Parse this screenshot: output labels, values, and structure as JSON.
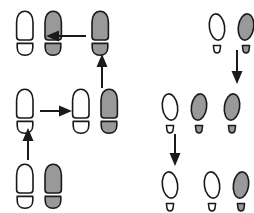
{
  "diagram": {
    "title": "Footprint sequence diagram",
    "canvas": {
      "width": 254,
      "height": 213,
      "background": "#ffffff"
    },
    "colors": {
      "outline": "#1a1a1a",
      "left_foot_fill": "#ffffff",
      "right_foot_fill": "#999999",
      "arrow": "#1a1a1a"
    },
    "groups": [
      {
        "id": "shoe-sequence",
        "name": "shoe-print-sequence",
        "print_style": "shoe",
        "nodes": [
          {
            "id": "shoe-n1",
            "name": "shoe-pair-top-left",
            "x": 14,
            "y": 10,
            "feet": [
              "white",
              "gray"
            ],
            "label": "pair"
          },
          {
            "id": "shoe-n2",
            "name": "shoe-single-top-right",
            "x": 89,
            "y": 10,
            "feet": [
              "gray"
            ],
            "label": "single"
          },
          {
            "id": "shoe-n3",
            "name": "shoe-single-middle-left",
            "x": 14,
            "y": 88,
            "feet": [
              "white"
            ],
            "label": "single"
          },
          {
            "id": "shoe-n4",
            "name": "shoe-pair-middle-right",
            "x": 70,
            "y": 88,
            "feet": [
              "white",
              "gray"
            ],
            "label": "pair"
          },
          {
            "id": "shoe-n5",
            "name": "shoe-pair-bottom-left",
            "x": 14,
            "y": 163,
            "feet": [
              "white",
              "gray"
            ],
            "label": "pair"
          }
        ],
        "arrows": [
          {
            "id": "shoe-a1",
            "name": "arrow-left-top",
            "direction": "left",
            "x": 46,
            "y": 28,
            "length": 40
          },
          {
            "id": "shoe-a2",
            "name": "arrow-up-right",
            "direction": "up",
            "x": 94,
            "y": 54,
            "length": 34
          },
          {
            "id": "shoe-a3",
            "name": "arrow-right-middle",
            "direction": "right",
            "x": 40,
            "y": 103,
            "length": 32
          },
          {
            "id": "shoe-a4",
            "name": "arrow-up-left",
            "direction": "up",
            "x": 20,
            "y": 128,
            "length": 32
          }
        ]
      },
      {
        "id": "oval-sequence",
        "name": "oval-print-sequence",
        "print_style": "oval",
        "nodes": [
          {
            "id": "oval-n1",
            "name": "oval-pair-top-right",
            "x": 206,
            "y": 12,
            "feet": [
              "white",
              "gray"
            ],
            "label": "pair"
          },
          {
            "id": "oval-n2",
            "name": "oval-single-middle-right",
            "x": 221,
            "y": 92,
            "feet": [
              "gray"
            ],
            "label": "single"
          },
          {
            "id": "oval-n3",
            "name": "oval-pair-middle-left",
            "x": 159,
            "y": 92,
            "feet": [
              "white",
              "gray"
            ],
            "label": "pair"
          },
          {
            "id": "oval-n4",
            "name": "oval-single-bottom-left",
            "x": 159,
            "y": 170,
            "feet": [
              "white"
            ],
            "label": "single"
          },
          {
            "id": "oval-n5",
            "name": "oval-pair-bottom-right",
            "x": 201,
            "y": 170,
            "feet": [
              "white",
              "gray"
            ],
            "label": "pair"
          }
        ],
        "arrows": [
          {
            "id": "oval-a1",
            "name": "arrow-down-right",
            "direction": "down",
            "x": 229,
            "y": 50,
            "length": 34
          },
          {
            "id": "oval-a2",
            "name": "arrow-down-left",
            "direction": "down",
            "x": 167,
            "y": 134,
            "length": 32
          }
        ]
      }
    ]
  }
}
